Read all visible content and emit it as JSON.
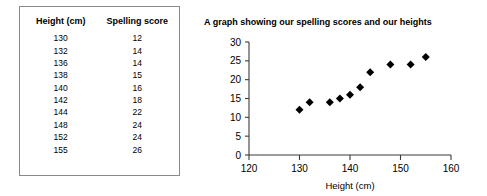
{
  "table": {
    "headers": [
      "Height (cm)",
      "Spelling score"
    ],
    "rows": [
      [
        "130",
        "12"
      ],
      [
        "132",
        "14"
      ],
      [
        "136",
        "14"
      ],
      [
        "138",
        "15"
      ],
      [
        "140",
        "16"
      ],
      [
        "142",
        "18"
      ],
      [
        "144",
        "22"
      ],
      [
        "148",
        "24"
      ],
      [
        "152",
        "24"
      ],
      [
        "155",
        "26"
      ]
    ]
  },
  "chart_data": {
    "type": "scatter",
    "title": "A graph showing our spelling scores and our heights",
    "xlabel": "Height (cm)",
    "ylabel": "",
    "xlim": [
      120,
      160
    ],
    "ylim": [
      0,
      30
    ],
    "xticks": [
      "120",
      "130",
      "140",
      "150",
      "160"
    ],
    "yticks": [
      "0",
      "5",
      "10",
      "15",
      "20",
      "25",
      "30"
    ],
    "grid": false,
    "legend": false,
    "marker": "diamond",
    "marker_color": "#000000",
    "x": [
      130,
      132,
      136,
      138,
      140,
      142,
      144,
      148,
      152,
      155
    ],
    "y": [
      12,
      14,
      14,
      15,
      16,
      18,
      22,
      24,
      24,
      26
    ]
  }
}
